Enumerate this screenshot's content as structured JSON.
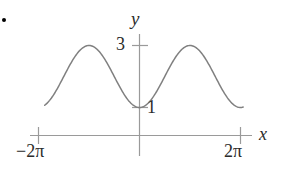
{
  "figure": {
    "background_color": "#ffffff",
    "bullet_marker": "•",
    "axis_color": "#9a9a9a",
    "curve_color": "#808080",
    "text_color": "#2b2b2b"
  },
  "labels": {
    "y_axis": "y",
    "x_axis": "x",
    "y_tick_high": "3",
    "y_tick_low": "1",
    "x_tick_left": "−2π",
    "x_tick_right": "2π"
  },
  "chart_data": {
    "type": "line",
    "title": "",
    "xlabel": "x",
    "ylabel": "y",
    "xlim": [
      -6.2832,
      6.2832
    ],
    "ylim": [
      0,
      3.6
    ],
    "grid": false,
    "legend": null,
    "xticks": [
      -6.2832,
      6.2832
    ],
    "xtick_labels": [
      "−2π",
      "2π"
    ],
    "yticks": [
      1,
      3
    ],
    "ytick_labels": [
      "1",
      "3"
    ],
    "function": "y = 2 + cos(x + pi)",
    "midline": 2,
    "amplitude": 1,
    "period": 6.2832,
    "series": [
      {
        "name": "curve",
        "x": [
          -5.6,
          -5.18,
          -4.71,
          -4.19,
          -3.67,
          -3.14,
          -2.62,
          -2.09,
          -1.57,
          -1.05,
          -0.52,
          0.0,
          0.52,
          1.05,
          1.57,
          2.09,
          2.62,
          3.14,
          3.67,
          4.19,
          4.71,
          5.18,
          5.6
        ],
        "y": [
          2.79,
          2.95,
          3.0,
          2.95,
          2.79,
          2.5,
          2.21,
          1.87,
          1.5,
          1.13,
          1.02,
          1.0,
          1.02,
          1.13,
          1.5,
          2.21,
          2.79,
          3.0,
          2.79,
          2.21,
          1.5,
          1.05,
          1.4
        ]
      }
    ],
    "key_points": [
      {
        "label": "left-endpoint",
        "x": -5.9,
        "y": 2.55
      },
      {
        "label": "first-maximum",
        "x": -4.71,
        "y": 3.0
      },
      {
        "label": "first-minimum",
        "x": -1.8,
        "y": 1.0
      },
      {
        "label": "second-maximum",
        "x": 1.5,
        "y": 3.0
      },
      {
        "label": "second-minimum",
        "x": 4.6,
        "y": 1.0
      },
      {
        "label": "right-endpoint",
        "x": 6.45,
        "y": 2.55
      }
    ]
  }
}
